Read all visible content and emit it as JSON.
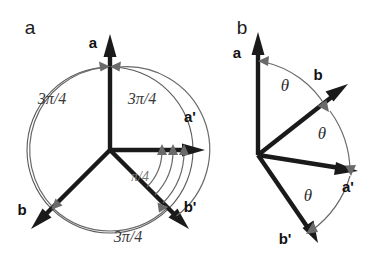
{
  "figure": {
    "background_color": "#ffffff",
    "ink_color": "#1a1a1a",
    "arc_color": "#6a6a6a",
    "faint_arc_color": "#7a7a7a",
    "panels": [
      {
        "id": "panel-a",
        "label": "a",
        "label_x": 30,
        "label_y": 34,
        "origin_x": 110,
        "origin_y": 150,
        "circle_radius": 83,
        "vectors": [
          {
            "name": "a",
            "label": "a",
            "angle_deg": 90,
            "length": 112,
            "label_x": 93,
            "label_y": 48
          },
          {
            "name": "a-prime",
            "label": "a'",
            "angle_deg": 0,
            "length": 95,
            "label_x": 190,
            "label_y": 122
          },
          {
            "name": "b",
            "label": "b",
            "angle_deg": 225,
            "length": 110,
            "label_x": 22,
            "label_y": 215
          },
          {
            "name": "b-prime",
            "label": "b'",
            "angle_deg": 315,
            "length": 110,
            "label_x": 190,
            "label_y": 212
          }
        ],
        "angle_labels": [
          {
            "name": "angle-a-to-b",
            "text": "3π/4",
            "x": 52,
            "y": 104
          },
          {
            "name": "angle-a-to-aprime",
            "text": "3π/4",
            "x": 122,
            "y": 104
          },
          {
            "name": "angle-b-to-bprime",
            "text": "3π/4",
            "x": 103,
            "y": 238
          },
          {
            "name": "angle-quarter-pi",
            "text": "π/4",
            "x": 136,
            "y": 177
          }
        ]
      },
      {
        "id": "panel-b",
        "label": "b",
        "label_x": 242,
        "label_y": 34,
        "origin_x": 258,
        "origin_y": 155,
        "vectors": [
          {
            "name": "a",
            "label": "a",
            "angle_deg": 90,
            "length": 112,
            "label_x": 237,
            "label_y": 58
          },
          {
            "name": "b",
            "label": "b",
            "angle_deg": 38,
            "length": 102,
            "label_x": 318,
            "label_y": 80
          },
          {
            "name": "a-prime",
            "label": "a'",
            "angle_deg": -8,
            "length": 105,
            "label_x": 341,
            "label_y": 192
          },
          {
            "name": "b-prime",
            "label": "b'",
            "angle_deg": -58,
            "length": 100,
            "label_x": 277,
            "label_y": 244
          }
        ],
        "angle_labels": [
          {
            "name": "theta-a-to-b",
            "text": "θ",
            "x": 285,
            "y": 91
          },
          {
            "name": "theta-b-to-aprime",
            "text": "θ",
            "x": 322,
            "y": 139
          },
          {
            "name": "theta-aprime-to-bprime",
            "text": "θ",
            "x": 308,
            "y": 201
          }
        ]
      }
    ]
  }
}
